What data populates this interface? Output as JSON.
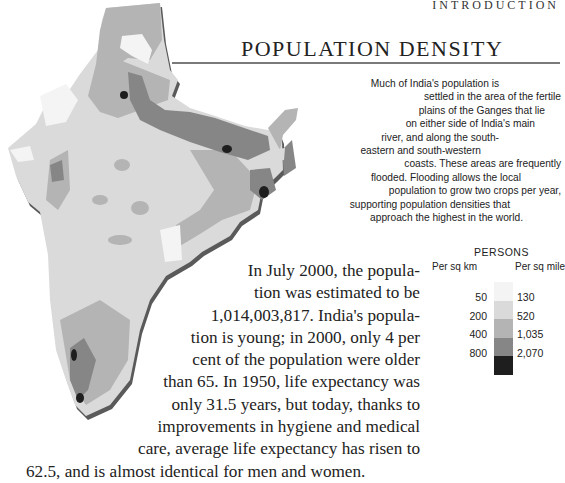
{
  "header": {
    "section_label": "INTRODUCTION",
    "title": "POPULATION DENSITY"
  },
  "caption": {
    "lines": [
      "Much of India's population is",
      "settled in the area of the fertile",
      "plains of the Ganges that lie",
      "on either side of India's main",
      "river, and along the south-",
      "eastern and south-western",
      "coasts. These areas are frequently",
      "flooded. Flooding allows the local",
      "population to grow two crops per year,",
      "supporting population densities that",
      "approach the highest in the world."
    ]
  },
  "body": {
    "lines": [
      "In July 2000, the popula-",
      "tion was estimated to be",
      "1,014,003,817. India's popula-",
      "tion is young; in 2000, only 4 per",
      "cent of the population were older",
      "than 65. In 1950, life expectancy was",
      "only 31.5 years, but today, thanks to",
      "improvements in hygiene and medical",
      "care, average life expectancy has risen to",
      "62.5, and is almost identical for men and women."
    ]
  },
  "legend": {
    "title": "PERSONS",
    "unit_left": "Per sq km",
    "unit_right": "Per sq mile",
    "thresholds_km": [
      "50",
      "200",
      "400",
      "800"
    ],
    "thresholds_mile": [
      "130",
      "520",
      "1,035",
      "2,070"
    ],
    "colors": [
      "#f4f4f4",
      "#dadada",
      "#b4b4b4",
      "#868686",
      "#1e1e1e"
    ]
  },
  "map": {
    "subject": "India population density choropleth",
    "colors": {
      "lowest": "#f4f4f4",
      "low": "#dadada",
      "mid": "#b4b4b4",
      "high": "#868686",
      "highest": "#1e1e1e",
      "edge": "#5a5a5a"
    }
  }
}
